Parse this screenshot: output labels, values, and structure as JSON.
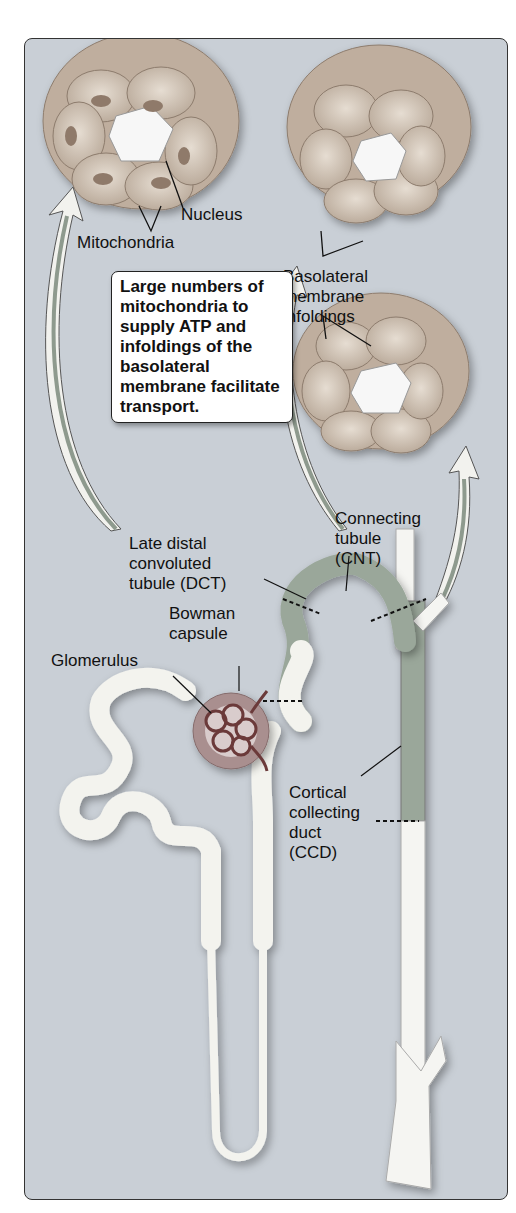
{
  "diagram": {
    "type": "anatomical illustration",
    "labels": {
      "nucleus": "Nucleus",
      "mitochondria": "Mitochondria",
      "basolateral": "Basolateral\nmembrane\ninfoldings",
      "late_dct": "Late distal\nconvoluted\ntubule (DCT)",
      "cnt": "Connecting\ntubule\n(CNT)",
      "bowman": "Bowman\ncapsule",
      "glomerulus": "Glomerulus",
      "ccd": "Cortical\ncollecting\nduct\n(CCD)"
    },
    "callout": "Large numbers of mitochondria to supply ATP and infoldings of the basolateral membrane facilitate transport.",
    "colors": {
      "background": "#c9cfd6",
      "tubule": "#f3f3ee",
      "segment_dct_cnt": "#9aa79a",
      "glomerulus": "#6b3a3a",
      "bowman": "#a98f8f",
      "cell": "#c8b8a8"
    }
  }
}
